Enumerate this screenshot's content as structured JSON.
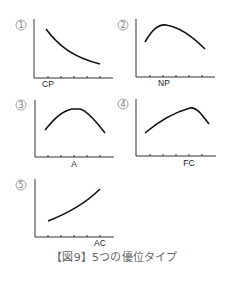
{
  "figure": {
    "caption": "【図9】5つの優位タイプ",
    "panels": [
      {
        "number": "①",
        "numeral": "1",
        "label": "CP",
        "shape": "decreasing"
      },
      {
        "number": "②",
        "numeral": "2",
        "label": "NP",
        "shape": "early-peak"
      },
      {
        "number": "③",
        "numeral": "3",
        "label": "A",
        "shape": "middle-peak"
      },
      {
        "number": "④",
        "numeral": "4",
        "label": "FC",
        "shape": "late-peak"
      },
      {
        "number": "⑤",
        "numeral": "5",
        "label": "AC",
        "shape": "increasing"
      }
    ],
    "colors": {
      "axis": "#333333",
      "curve": "#111111",
      "caption": "#666666",
      "number": "#777777"
    }
  }
}
